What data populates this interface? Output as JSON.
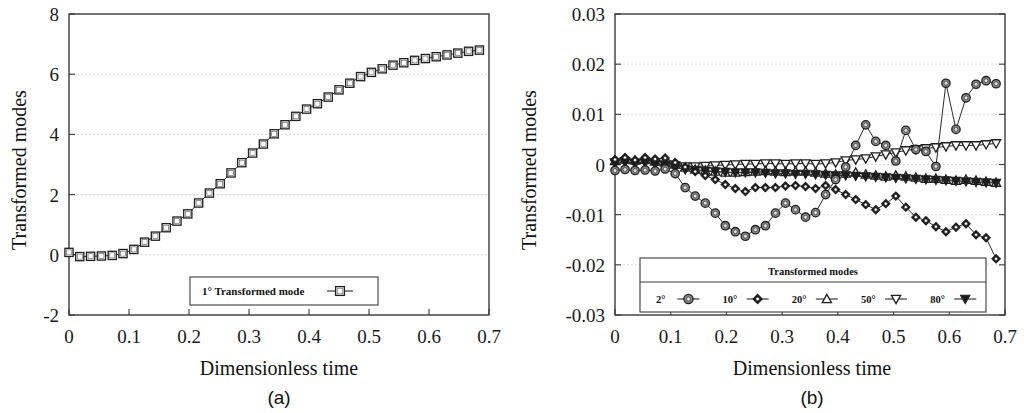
{
  "figure": {
    "panels": [
      {
        "id": "a",
        "caption": "(a)",
        "xlabel": "Dimensionless time",
        "ylabel": "Transformed modes"
      },
      {
        "id": "b",
        "caption": "(b)",
        "xlabel": "Dimensionless time",
        "ylabel": "Transformed modes"
      }
    ]
  },
  "chart_data": [
    {
      "type": "line",
      "panel": "a",
      "title": "",
      "xlabel": "Dimensionless time",
      "ylabel": "Transformed modes",
      "xlim": [
        0,
        0.7
      ],
      "ylim": [
        -2,
        8
      ],
      "xticks": [
        "0",
        "0.1",
        "0.2",
        "0.3",
        "0.4",
        "0.5",
        "0.6",
        "0.7"
      ],
      "xtick_values": [
        0,
        0.1,
        0.2,
        0.3,
        0.4,
        0.5,
        0.6,
        0.7
      ],
      "yticks": [
        "8",
        "6",
        "4",
        "2",
        "0",
        "-2"
      ],
      "ytick_values": [
        8,
        6,
        4,
        2,
        0,
        -2
      ],
      "grid": true,
      "legend_position": "bottom-center",
      "legend_title": "",
      "series": [
        {
          "name": "1° Transformed mode",
          "marker": "open-square",
          "x": [
            0.0,
            0.018,
            0.036,
            0.054,
            0.072,
            0.09,
            0.108,
            0.126,
            0.144,
            0.162,
            0.18,
            0.198,
            0.216,
            0.234,
            0.252,
            0.27,
            0.288,
            0.306,
            0.324,
            0.342,
            0.36,
            0.378,
            0.396,
            0.414,
            0.432,
            0.45,
            0.468,
            0.486,
            0.504,
            0.522,
            0.54,
            0.558,
            0.576,
            0.594,
            0.612,
            0.63,
            0.648,
            0.666,
            0.684
          ],
          "y": [
            0.08,
            -0.06,
            -0.05,
            -0.04,
            -0.02,
            0.04,
            0.18,
            0.42,
            0.62,
            0.9,
            1.12,
            1.36,
            1.72,
            2.05,
            2.36,
            2.72,
            3.06,
            3.38,
            3.68,
            4.02,
            4.32,
            4.6,
            4.84,
            5.02,
            5.24,
            5.48,
            5.7,
            5.92,
            6.06,
            6.18,
            6.3,
            6.38,
            6.46,
            6.52,
            6.58,
            6.64,
            6.7,
            6.76,
            6.8
          ]
        }
      ]
    },
    {
      "type": "line",
      "panel": "b",
      "title": "",
      "xlabel": "Dimensionless time",
      "ylabel": "Transformed modes",
      "xlim": [
        0,
        0.7
      ],
      "ylim": [
        -0.03,
        0.03
      ],
      "xticks": [
        "0",
        "0.1",
        "0.2",
        "0.3",
        "0.4",
        "0.5",
        "0.6",
        "0.7"
      ],
      "xtick_values": [
        0,
        0.1,
        0.2,
        0.3,
        0.4,
        0.5,
        0.6,
        0.7
      ],
      "yticks": [
        "0.03",
        "0.02",
        "0.01",
        "0",
        "-0.01",
        "-0.02",
        "-0.03"
      ],
      "ytick_values": [
        0.03,
        0.02,
        0.01,
        0,
        -0.01,
        -0.02,
        -0.03
      ],
      "grid": true,
      "legend_position": "bottom-center",
      "legend_title": "Transformed modes",
      "series": [
        {
          "name": "2°",
          "marker": "circle",
          "x": [
            0.0,
            0.018,
            0.036,
            0.054,
            0.072,
            0.09,
            0.108,
            0.126,
            0.144,
            0.162,
            0.18,
            0.198,
            0.216,
            0.234,
            0.252,
            0.27,
            0.288,
            0.306,
            0.324,
            0.342,
            0.36,
            0.378,
            0.396,
            0.414,
            0.432,
            0.45,
            0.468,
            0.486,
            0.504,
            0.522,
            0.54,
            0.558,
            0.576,
            0.594,
            0.612,
            0.63,
            0.648,
            0.666,
            0.684
          ],
          "y": [
            -0.0012,
            -0.001,
            -0.0012,
            -0.0011,
            -0.0013,
            -0.0009,
            -0.0018,
            -0.0046,
            -0.0063,
            -0.0077,
            -0.0097,
            -0.0122,
            -0.0134,
            -0.0143,
            -0.013,
            -0.0122,
            -0.0097,
            -0.0077,
            -0.009,
            -0.0105,
            -0.0096,
            -0.006,
            -0.003,
            -0.0005,
            0.0038,
            0.0079,
            0.0046,
            0.0038,
            0.0007,
            0.0068,
            0.003,
            0.0026,
            -0.0004,
            0.0162,
            0.007,
            0.0133,
            0.016,
            0.0167,
            0.0161
          ]
        },
        {
          "name": "10°",
          "marker": "diamond",
          "x": [
            0.0,
            0.018,
            0.036,
            0.054,
            0.072,
            0.09,
            0.108,
            0.126,
            0.144,
            0.162,
            0.18,
            0.198,
            0.216,
            0.234,
            0.252,
            0.27,
            0.288,
            0.306,
            0.324,
            0.342,
            0.36,
            0.378,
            0.396,
            0.414,
            0.432,
            0.45,
            0.468,
            0.486,
            0.504,
            0.522,
            0.54,
            0.558,
            0.576,
            0.594,
            0.612,
            0.63,
            0.648,
            0.666,
            0.684
          ],
          "y": [
            0.001,
            0.0014,
            0.0009,
            0.0014,
            0.0011,
            0.0013,
            0.0004,
            -0.0005,
            -0.0014,
            -0.0022,
            -0.003,
            -0.004,
            -0.0048,
            -0.0054,
            -0.0046,
            -0.0046,
            -0.0046,
            -0.0043,
            -0.0042,
            -0.0044,
            -0.0048,
            -0.0042,
            -0.005,
            -0.006,
            -0.007,
            -0.008,
            -0.009,
            -0.0078,
            -0.0063,
            -0.0085,
            -0.0105,
            -0.0112,
            -0.0124,
            -0.0134,
            -0.0125,
            -0.0118,
            -0.014,
            -0.0146,
            -0.0188
          ]
        },
        {
          "name": "20°",
          "marker": "up-triangle",
          "x": [
            0.0,
            0.018,
            0.036,
            0.054,
            0.072,
            0.09,
            0.108,
            0.126,
            0.144,
            0.162,
            0.18,
            0.198,
            0.216,
            0.234,
            0.252,
            0.27,
            0.288,
            0.306,
            0.324,
            0.342,
            0.36,
            0.378,
            0.396,
            0.414,
            0.432,
            0.45,
            0.468,
            0.486,
            0.504,
            0.522,
            0.54,
            0.558,
            0.576,
            0.594,
            0.612,
            0.63,
            0.648,
            0.666,
            0.684
          ],
          "y": [
            0.0007,
            0.001,
            0.0008,
            0.001,
            0.0006,
            0.0004,
            0.0,
            -0.0006,
            -0.001,
            -0.0012,
            -0.0014,
            -0.0016,
            -0.0016,
            -0.0015,
            -0.0014,
            -0.0013,
            -0.0014,
            -0.0015,
            -0.0014,
            -0.0014,
            -0.0016,
            -0.0018,
            -0.002,
            -0.0018,
            -0.0016,
            -0.002,
            -0.0022,
            -0.0024,
            -0.0022,
            -0.0024,
            -0.0026,
            -0.0028,
            -0.0028,
            -0.003,
            -0.0032,
            -0.003,
            -0.0032,
            -0.0034,
            -0.0036
          ]
        },
        {
          "name": "50°",
          "marker": "down-triangle-open",
          "x": [
            0.0,
            0.018,
            0.036,
            0.054,
            0.072,
            0.09,
            0.108,
            0.126,
            0.144,
            0.162,
            0.18,
            0.198,
            0.216,
            0.234,
            0.252,
            0.27,
            0.288,
            0.306,
            0.324,
            0.342,
            0.36,
            0.378,
            0.396,
            0.414,
            0.432,
            0.45,
            0.468,
            0.486,
            0.504,
            0.522,
            0.54,
            0.558,
            0.576,
            0.594,
            0.612,
            0.63,
            0.648,
            0.666,
            0.684
          ],
          "y": [
            0.0004,
            0.0006,
            0.0003,
            0.0005,
            0.0002,
            0.0,
            -0.0002,
            -0.0004,
            -0.0004,
            -0.0003,
            -0.0002,
            -0.0001,
            0.0,
            0.0001,
            0.0001,
            0.0002,
            0.0002,
            0.0001,
            0.0002,
            0.0002,
            0.0001,
            0.0002,
            0.0004,
            0.0008,
            0.001,
            0.0012,
            0.0016,
            0.002,
            0.0024,
            0.0028,
            0.003,
            0.0032,
            0.0034,
            0.0036,
            0.0038,
            0.0038,
            0.0038,
            0.004,
            0.0042
          ]
        },
        {
          "name": "80°",
          "marker": "down-triangle-filled",
          "x": [
            0.0,
            0.018,
            0.036,
            0.054,
            0.072,
            0.09,
            0.108,
            0.126,
            0.144,
            0.162,
            0.18,
            0.198,
            0.216,
            0.234,
            0.252,
            0.27,
            0.288,
            0.306,
            0.324,
            0.342,
            0.36,
            0.378,
            0.396,
            0.414,
            0.432,
            0.45,
            0.468,
            0.486,
            0.504,
            0.522,
            0.54,
            0.558,
            0.576,
            0.594,
            0.612,
            0.63,
            0.648,
            0.666,
            0.684
          ],
          "y": [
            0.0002,
            0.0004,
            0.0001,
            0.0003,
            0.0,
            -0.0002,
            -0.0006,
            -0.001,
            -0.0012,
            -0.0013,
            -0.0014,
            -0.0015,
            -0.0016,
            -0.0016,
            -0.0016,
            -0.0017,
            -0.0018,
            -0.0018,
            -0.0019,
            -0.0019,
            -0.002,
            -0.0021,
            -0.0022,
            -0.0022,
            -0.0023,
            -0.0024,
            -0.0025,
            -0.0026,
            -0.0027,
            -0.0028,
            -0.0029,
            -0.003,
            -0.0031,
            -0.0032,
            -0.0033,
            -0.0034,
            -0.0035,
            -0.0036,
            -0.0037
          ]
        }
      ]
    }
  ]
}
